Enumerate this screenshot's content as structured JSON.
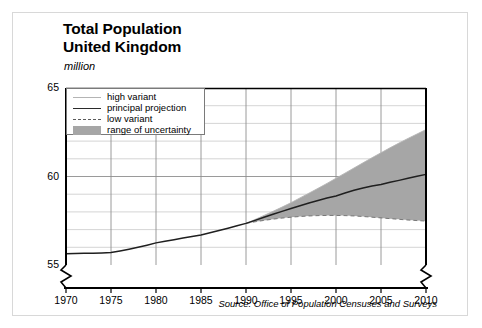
{
  "figure": {
    "title_line1": "Total Population",
    "title_line2": "United Kingdom",
    "unit_label": "million",
    "source": "Source: Office of Population Censuses and Surveys"
  },
  "legend": {
    "items": [
      {
        "label": "high variant",
        "marker": "line-light",
        "color": "#b4b4b4"
      },
      {
        "label": "principal projection",
        "marker": "line-solid",
        "color": "#2b2b2b"
      },
      {
        "label": "low variant",
        "marker": "line-dashed",
        "color": "#5a5a5a"
      },
      {
        "label": "range of uncertainty",
        "marker": "swatch",
        "color": "#a6a6a6"
      }
    ]
  },
  "chart_data": {
    "type": "line",
    "title": "Total Population United Kingdom",
    "subtitle": "",
    "xlabel": "",
    "ylabel": "million",
    "ylim": [
      55,
      65
    ],
    "xlim": [
      1970,
      2010
    ],
    "grid": true,
    "y_major_ticks": [
      55,
      60,
      65
    ],
    "y_minor_ticks": [
      56,
      57,
      58,
      59,
      61,
      62,
      63,
      64
    ],
    "x_ticks": [
      1970,
      1975,
      1980,
      1985,
      1990,
      1995,
      2000,
      2005,
      2010
    ],
    "x_tick_labels": [
      "1970",
      "1975",
      "1980",
      "1985",
      "1990",
      "1995",
      "2000",
      "2005",
      "2010"
    ],
    "y_tick_labels": [
      "55",
      "60",
      "65"
    ],
    "axis_break": {
      "y_axis": true,
      "right_axis": true,
      "below_value": 55
    },
    "legend_position": "upper-left-inside",
    "projection_start": 1990,
    "x": [
      1970,
      1971,
      1972,
      1973,
      1974,
      1975,
      1976,
      1977,
      1978,
      1979,
      1980,
      1981,
      1982,
      1983,
      1984,
      1985,
      1986,
      1987,
      1988,
      1989,
      1990,
      1991,
      1992,
      1993,
      1994,
      1995,
      1996,
      1997,
      1998,
      1999,
      2000,
      2001,
      2002,
      2003,
      2004,
      2005,
      2006,
      2007,
      2008,
      2009,
      2010
    ],
    "series": [
      {
        "name": "principal projection",
        "style": "solid",
        "color": "#2b2b2b",
        "values": [
          55.63,
          55.65,
          55.66,
          55.67,
          55.68,
          55.7,
          55.79,
          55.89,
          56.0,
          56.12,
          56.25,
          56.34,
          56.43,
          56.52,
          56.61,
          56.7,
          56.82,
          56.95,
          57.08,
          57.22,
          57.35,
          57.52,
          57.7,
          57.87,
          58.03,
          58.19,
          58.35,
          58.5,
          58.64,
          58.78,
          58.9,
          59.07,
          59.22,
          59.35,
          59.46,
          59.55,
          59.67,
          59.78,
          59.9,
          60.01,
          60.12
        ]
      },
      {
        "name": "high variant",
        "style": "light",
        "color": "#b4b4b4",
        "values": [
          null,
          null,
          null,
          null,
          null,
          null,
          null,
          null,
          null,
          null,
          null,
          null,
          null,
          null,
          null,
          null,
          null,
          null,
          null,
          null,
          57.35,
          57.57,
          57.8,
          58.03,
          58.27,
          58.52,
          58.79,
          59.06,
          59.33,
          59.61,
          59.9,
          60.19,
          60.48,
          60.77,
          61.06,
          61.34,
          61.62,
          61.89,
          62.15,
          62.4,
          62.65
        ]
      },
      {
        "name": "low variant",
        "style": "dashed",
        "color": "#5a5a5a",
        "values": [
          null,
          null,
          null,
          null,
          null,
          null,
          null,
          null,
          null,
          null,
          null,
          null,
          null,
          null,
          null,
          null,
          null,
          null,
          null,
          null,
          57.35,
          57.44,
          57.52,
          57.59,
          57.65,
          57.7,
          57.74,
          57.77,
          57.79,
          57.8,
          57.8,
          57.79,
          57.77,
          57.74,
          57.7,
          57.66,
          57.62,
          57.58,
          57.54,
          57.51,
          57.48
        ]
      }
    ],
    "uncertainty_band": {
      "name": "range of uncertainty",
      "color": "#a6a6a6",
      "from_year": 1990,
      "to_year": 2010,
      "upper_series": "high variant",
      "lower_series": "low variant"
    }
  }
}
